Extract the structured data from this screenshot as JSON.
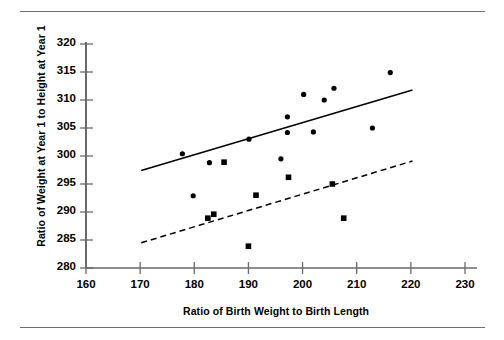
{
  "figure": {
    "rules": [
      "top-rule",
      "bottom-rule"
    ],
    "xlabel": "Ratio of Birth Weight to Birth Length",
    "ylabel": "Ratio of Weight at Year 1 to Height at Year 1"
  },
  "chart_data": {
    "type": "scatter",
    "title": "",
    "xlabel": "Ratio of Birth Weight to Birth Length",
    "ylabel": "Ratio of Weight at Year 1 to Height at Year 1",
    "xlim": [
      160,
      230
    ],
    "ylim": [
      280,
      320
    ],
    "xticks": [
      160,
      170,
      180,
      190,
      200,
      210,
      220,
      230
    ],
    "yticks": [
      280,
      285,
      290,
      295,
      300,
      305,
      310,
      315,
      320
    ],
    "grid": false,
    "legend": "none",
    "series": [
      {
        "name": "circle-group",
        "marker": "circle",
        "color": "#000000",
        "points": [
          {
            "x": 177.8,
            "y": 300.4
          },
          {
            "x": 182.8,
            "y": 298.8
          },
          {
            "x": 179.8,
            "y": 292.9
          },
          {
            "x": 190.1,
            "y": 303.0
          },
          {
            "x": 197.2,
            "y": 304.2
          },
          {
            "x": 197.2,
            "y": 307.0
          },
          {
            "x": 200.2,
            "y": 311.0
          },
          {
            "x": 196.0,
            "y": 299.5
          },
          {
            "x": 202.0,
            "y": 304.3
          },
          {
            "x": 204.0,
            "y": 310.0
          },
          {
            "x": 205.8,
            "y": 312.1
          },
          {
            "x": 212.9,
            "y": 305.0
          },
          {
            "x": 216.2,
            "y": 314.9
          }
        ]
      },
      {
        "name": "square-group",
        "marker": "square",
        "color": "#000000",
        "points": [
          {
            "x": 185.5,
            "y": 298.9
          },
          {
            "x": 182.5,
            "y": 288.9
          },
          {
            "x": 183.6,
            "y": 289.6
          },
          {
            "x": 190.0,
            "y": 283.9
          },
          {
            "x": 191.4,
            "y": 293.0
          },
          {
            "x": 197.4,
            "y": 296.2
          },
          {
            "x": 205.5,
            "y": 295.0
          },
          {
            "x": 207.6,
            "y": 288.9
          }
        ]
      }
    ],
    "trend_lines": [
      {
        "name": "solid-trend-line",
        "style": "solid",
        "color": "#000000",
        "x_start": 170.2,
        "y_start": 297.4,
        "x_end": 220.3,
        "y_end": 311.8
      },
      {
        "name": "dashed-trend-line",
        "style": "dashed",
        "color": "#000000",
        "x_start": 170.2,
        "y_start": 284.5,
        "x_end": 220.3,
        "y_end": 299.1
      }
    ]
  }
}
